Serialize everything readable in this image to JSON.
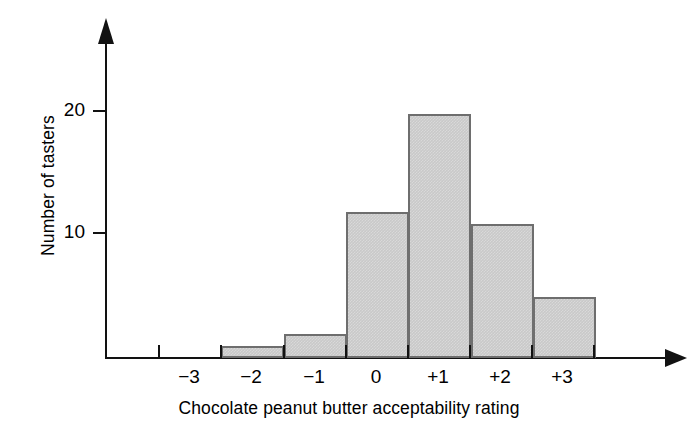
{
  "chart_data": {
    "type": "bar",
    "title": "",
    "subtitle": "",
    "xlabel": "Chocolate peanut butter acceptability rating",
    "ylabel": "Number of tasters",
    "categories": [
      "−3",
      "−2",
      "−1",
      "0",
      "+1",
      "+2",
      "+3"
    ],
    "values": [
      0,
      1,
      2,
      12,
      20,
      11,
      5
    ],
    "xtick_labels": [
      "−3",
      "−2",
      "−1",
      "0",
      "+1",
      "+2",
      "+3"
    ],
    "ytick_labels": [
      "10",
      "20"
    ],
    "ytick_values": [
      10,
      20
    ],
    "ylim": [
      0,
      26
    ],
    "grid": false,
    "legend": false,
    "legend_position": "none",
    "bar_fill_color": "#c9c9c9",
    "bar_edge_color": "#6e6e6e",
    "axis_color": "#121212",
    "background_color": "#ffffff",
    "axis_arrows": true
  }
}
